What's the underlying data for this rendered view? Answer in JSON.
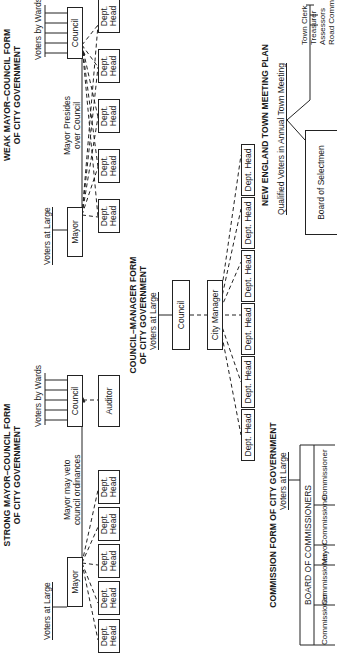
{
  "diagram": {
    "strong_mayor": {
      "title_line1": "STRONG MAYOR–COUNCIL FORM",
      "title_line2": "OF CITY GOVERNMENT",
      "voters_at_large": "Voters at Large",
      "voters_by_wards": "Voters by Wards",
      "mayor": "Mayor",
      "council": "Council",
      "auditor": "Auditor",
      "veto_note_line1": "Mayor may veto",
      "veto_note_line2": "council ordinances",
      "dept_heads": [
        "Dept. Head",
        "Dept. Head",
        "Dept. Head",
        "Dept. Head",
        "Dept. Head"
      ]
    },
    "weak_mayor": {
      "title_line1": "WEAK MAYOR–COUNCIL FORM",
      "title_line2": "OF CITY GOVERNMENT",
      "voters_at_large": "Voters at Large",
      "voters_by_wards": "Voters by Wards",
      "mayor": "Mayor",
      "council": "Council",
      "presides_note_line1": "Mayor Presides",
      "presides_note_line2": "over Council",
      "dept_heads": [
        "Dept. Head",
        "Dept. Head",
        "Dept. Head",
        "Dept. Head",
        "Dept. Head"
      ]
    },
    "council_manager": {
      "title_line1": "COUNCIL–MANAGER FORM",
      "title_line2": "OF CITY GOVERNMENT",
      "voters_at_large": "Voters at Large",
      "council": "Council",
      "city_manager": "City Manager",
      "dept_heads": [
        "Dept. Head",
        "Dept. Head",
        "Dept. Head",
        "Dept. Head",
        "Dept. Head",
        "Dept. Head"
      ]
    },
    "commission": {
      "title": "COMMISSION FORM OF CITY GOVERNMENT",
      "voters_at_large": "Voters at Large",
      "board": "BOARD OF COMMISSIONERS",
      "members": [
        "Commissioner",
        "Commissioner",
        "Mayor",
        "Commissioner",
        "Commissioner"
      ]
    },
    "new_england": {
      "title": "NEW ENGLAND TOWN MEETING PLAN",
      "voters": "Qualified Voters in Annual Town Meeting",
      "board": "Board of Selectmen",
      "officers": [
        "Town Clerk",
        "Treasurer",
        "Assessors",
        "Road Commissioner"
      ]
    }
  }
}
